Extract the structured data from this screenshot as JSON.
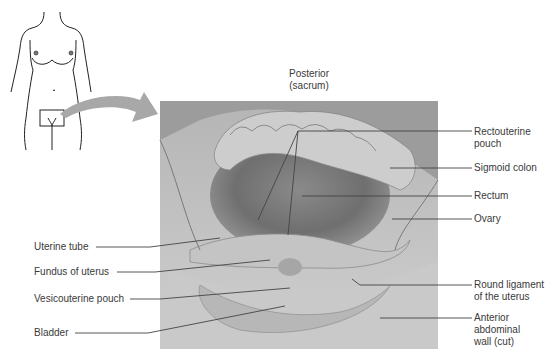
{
  "figure": {
    "orientation": {
      "line1": "Posterior",
      "line2": "(sacrum)"
    },
    "labels_right": [
      {
        "id": "rectouterine-pouch",
        "text": "Rectouterine\npouch"
      },
      {
        "id": "sigmoid-colon",
        "text": "Sigmoid colon"
      },
      {
        "id": "rectum",
        "text": "Rectum"
      },
      {
        "id": "ovary",
        "text": "Ovary"
      },
      {
        "id": "round-ligament",
        "text": "Round ligament\nof the uterus"
      },
      {
        "id": "anterior-abdominal-wall",
        "text": "Anterior\nabdominal\nwall (cut)"
      }
    ],
    "labels_left": [
      {
        "id": "uterine-tube",
        "text": "Uterine tube"
      },
      {
        "id": "fundus-of-uterus",
        "text": "Fundus of uterus"
      },
      {
        "id": "vesicouterine-pouch",
        "text": "Vesicouterine pouch"
      },
      {
        "id": "bladder",
        "text": "Bladder"
      }
    ],
    "colors": {
      "arrow": "#a8a8a8",
      "leader_line": "#444444",
      "outline": "#222222"
    }
  }
}
